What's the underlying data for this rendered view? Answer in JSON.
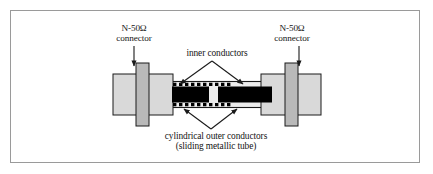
{
  "figure": {
    "domain": "diagram",
    "background_color": "#ffffff",
    "frame_border_color": "#9a9a9a"
  },
  "labels": {
    "left_connector": {
      "line1": "N-50Ω",
      "line2": "connector"
    },
    "right_connector": {
      "line1": "N-50Ω",
      "line2": "connector"
    },
    "inner_conductors": {
      "line1": "inner conductors"
    },
    "outer_conductors": {
      "line1": "cylindrical outer conductors",
      "line2": "(sliding metallic tube)"
    }
  },
  "colors": {
    "connector_body": "#d9d9d9",
    "connector_flange": "#b9b9b9",
    "outer_tube": "#e9e9e9",
    "inner_conductor": "#000000",
    "outline": "#1a1a1a",
    "leader_line": "#1a1a1a",
    "text": "#151515"
  },
  "parts": {
    "left_connector_body": "left N-type 50 ohm connector body",
    "left_connector_flange": "left connector flange",
    "right_connector_body": "right N-type 50 ohm connector body",
    "right_connector_flange": "right connector flange",
    "outer_tube": "cylindrical outer conductor / sliding metallic tube",
    "inner_conductor_left": "left inner conductor bar",
    "inner_conductor_right": "right inner conductor bar",
    "inner_gap": "gap between inner conductors"
  },
  "annotations": {
    "left_arrow": "arrow pointing down to left connector",
    "right_arrow": "arrow pointing down to right connector",
    "inner_leader": "peaked leader with two arrows to inner conductors",
    "outer_leader": "v-shaped leader with two arrows to outer conductors"
  }
}
